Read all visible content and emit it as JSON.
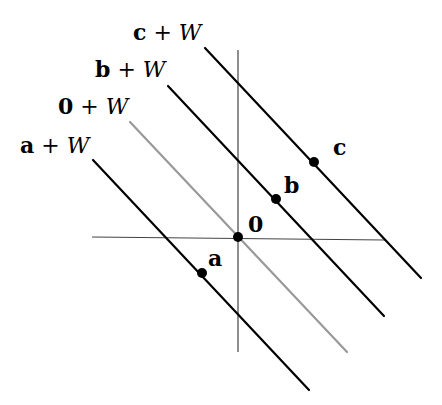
{
  "diagram": {
    "colors": {
      "background": "#ffffff",
      "line": "#000000",
      "subspace_line": "#999999",
      "axis": "#444444"
    },
    "axes": {
      "horizontal": {
        "x1": 92,
        "y1": 237,
        "x2": 385,
        "y2": 240
      },
      "vertical": {
        "x1": 238,
        "y1": 50,
        "x2": 238,
        "y2": 352
      }
    },
    "lines": [
      {
        "id": "a",
        "label_vec": "a",
        "label_rest": "+ W",
        "label_x": 20,
        "label_y": 153,
        "x1": 93,
        "y1": 160,
        "x2": 309,
        "y2": 390,
        "color": "#000000"
      },
      {
        "id": "0",
        "label_vec": "0",
        "label_rest": "+ W",
        "label_x": 58,
        "label_y": 114,
        "x1": 130,
        "y1": 122,
        "x2": 347,
        "y2": 352,
        "color": "#999999"
      },
      {
        "id": "b",
        "label_vec": "b",
        "label_rest": "+ W",
        "label_x": 95,
        "label_y": 77,
        "x1": 168,
        "y1": 86,
        "x2": 384,
        "y2": 316,
        "color": "#000000"
      },
      {
        "id": "c",
        "label_vec": "c",
        "label_rest": "+ W",
        "label_x": 133,
        "label_y": 40,
        "x1": 205,
        "y1": 48,
        "x2": 421,
        "y2": 278,
        "color": "#000000"
      }
    ],
    "points": [
      {
        "id": "a",
        "label": "a",
        "cx": 202,
        "cy": 273,
        "label_x": 208,
        "label_y": 266
      },
      {
        "id": "0",
        "label": "0",
        "cx": 238,
        "cy": 237,
        "label_x": 248,
        "label_y": 232
      },
      {
        "id": "b",
        "label": "b",
        "cx": 276,
        "cy": 199,
        "label_x": 284,
        "label_y": 193
      },
      {
        "id": "c",
        "label": "c",
        "cx": 314,
        "cy": 162,
        "label_x": 333,
        "label_y": 155
      }
    ]
  }
}
